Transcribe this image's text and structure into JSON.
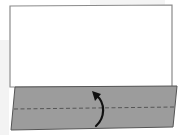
{
  "diagram": {
    "type": "origami-fold-step",
    "paper": {
      "fill": "#ffffff",
      "stroke": "#8a8a8a",
      "corners": [
        [
          10,
          6
        ],
        [
          172,
          5
        ],
        [
          172,
          86
        ],
        [
          10,
          86
        ]
      ]
    },
    "folded_flap": {
      "fill": "#9a9a9a",
      "stroke": "#555555",
      "corners": [
        [
          15,
          87
        ],
        [
          177,
          86
        ],
        [
          173,
          127
        ],
        [
          11,
          130
        ]
      ]
    },
    "fold_line": {
      "style": "dashed",
      "color": "#555555",
      "from": [
        14,
        109
      ],
      "to": [
        175,
        107
      ]
    },
    "arrow": {
      "direction": "up",
      "meaning": "fold-up",
      "color": "#111111"
    }
  }
}
